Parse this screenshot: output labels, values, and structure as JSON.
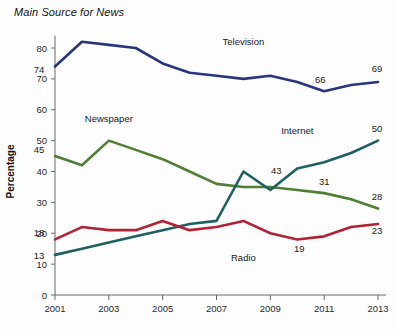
{
  "chart_data": {
    "type": "line",
    "title": "Main Source for News",
    "xlabel": "",
    "ylabel": "Percentage",
    "xlim": [
      2001,
      2013
    ],
    "ylim": [
      0,
      85
    ],
    "grid": false,
    "legend_position": "inline-labels",
    "x": [
      2001,
      2002,
      2003,
      2004,
      2005,
      2006,
      2007,
      2008,
      2009,
      2010,
      2011,
      2012,
      2013
    ],
    "x_ticks": [
      "2001",
      "2003",
      "2005",
      "2007",
      "2009",
      "2011",
      "2013"
    ],
    "x_tick_values": [
      2001,
      2003,
      2005,
      2007,
      2009,
      2011,
      2013
    ],
    "y_ticks": [
      "0",
      "10",
      "20",
      "30",
      "40",
      "50",
      "60",
      "70",
      "80"
    ],
    "y_tick_values": [
      0,
      10,
      20,
      30,
      40,
      50,
      60,
      70,
      80
    ],
    "series": [
      {
        "name": "Television",
        "color": "#27357e",
        "values": [
          74,
          82,
          81,
          80,
          75,
          72,
          71,
          70,
          71,
          69,
          66,
          68,
          69
        ],
        "label_x": 2008,
        "label_y": 81,
        "point_labels": [
          {
            "x": 2001,
            "y": 74,
            "text": "74",
            "dx": -16,
            "dy": 6
          },
          {
            "x": 2011,
            "y": 66,
            "text": "66",
            "dx": -4,
            "dy": -8
          },
          {
            "x": 2013,
            "y": 69,
            "text": "69",
            "dx": -1,
            "dy": -10
          }
        ]
      },
      {
        "name": "Newspaper",
        "color": "#4e7f33",
        "values": [
          45,
          42,
          50,
          47,
          44,
          40,
          36,
          35,
          35,
          34,
          33,
          31,
          28
        ],
        "label_x": 2003,
        "label_y": 56,
        "point_labels": [
          {
            "x": 2001,
            "y": 45,
            "text": "45",
            "dx": -16,
            "dy": -3
          },
          {
            "x": 2011,
            "y": 33,
            "text": "31",
            "dx": 0,
            "dy": -8
          },
          {
            "x": 2013,
            "y": 28,
            "text": "28",
            "dx": -1,
            "dy": -9
          }
        ]
      },
      {
        "name": "Internet",
        "color": "#1d5f63",
        "values": [
          13,
          15,
          17,
          19,
          21,
          23,
          24,
          40,
          34,
          41,
          43,
          46,
          50
        ],
        "label_x": 2010,
        "label_y": 52,
        "point_labels": [
          {
            "x": 2001,
            "y": 13,
            "text": "13",
            "dx": -16,
            "dy": 4
          },
          {
            "x": 2009,
            "y": 34,
            "text": "43",
            "dx": 6,
            "dy": -16
          },
          {
            "x": 2013,
            "y": 50,
            "text": "50",
            "dx": -1,
            "dy": -9
          }
        ]
      },
      {
        "name": "Radio",
        "color": "#b22234",
        "values": [
          18,
          22,
          21,
          21,
          24,
          21,
          22,
          24,
          20,
          18,
          19,
          22,
          23
        ],
        "label_x": 2008,
        "label_y": 11,
        "point_labels": [
          {
            "x": 2001,
            "y": 18,
            "text": "18",
            "dx": -16,
            "dy": -3
          },
          {
            "x": 2010,
            "y": 18,
            "text": "19",
            "dx": 2,
            "dy": 13
          },
          {
            "x": 2013,
            "y": 23,
            "text": "23",
            "dx": -1,
            "dy": 10
          }
        ]
      }
    ]
  }
}
